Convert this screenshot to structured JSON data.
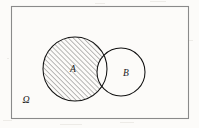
{
  "figure": {
    "kind": "venn-diagram",
    "background_color": "#fcfbf9"
  },
  "universe": {
    "label": "Ω",
    "label_name": "omega-universal-set-label",
    "border_color": "#8a8a8a",
    "fill_color": "#fcfbf9",
    "rect": {
      "x": 11,
      "y": 6,
      "width": 177,
      "height": 112
    },
    "label_position": {
      "x": 26,
      "y": 103
    }
  },
  "sets": [
    {
      "id": "A",
      "label": "A",
      "center": {
        "x": 75,
        "y": 69
      },
      "radius": 32,
      "stroke_color": "#111111",
      "fill": "hatched",
      "label_position": {
        "x": 73,
        "y": 72
      }
    },
    {
      "id": "B",
      "label": "B",
      "center": {
        "x": 121,
        "y": 72
      },
      "radius": 24,
      "stroke_color": "#111111",
      "fill": "white",
      "label_position": {
        "x": 126,
        "y": 76
      }
    }
  ],
  "hatching": {
    "region": "A \\ B",
    "angle_degrees": 45,
    "spacing_px": 3.5,
    "line_color": "#3a3a3a",
    "line_width": 0.7
  },
  "colors": {
    "ink": "#111111",
    "frame": "#8a8a8a",
    "paper": "#fcfbf9"
  }
}
